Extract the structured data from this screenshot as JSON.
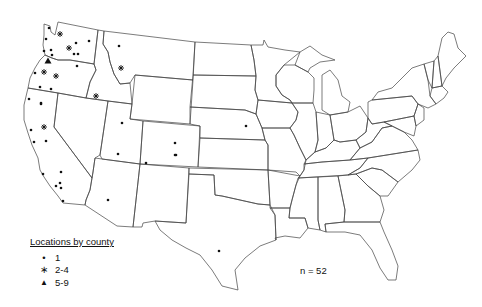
{
  "legend": {
    "title": "Locations by county",
    "items": [
      {
        "symbol": "dot",
        "glyph": "•",
        "label": "1"
      },
      {
        "symbol": "asterisk",
        "glyph": "∗",
        "label": "2-4"
      },
      {
        "symbol": "triangle",
        "glyph": "▲",
        "label": "5-9"
      }
    ]
  },
  "annotation": {
    "n_label": "n = 52"
  },
  "colors": {
    "boundary": "#444444",
    "marker": "#111111",
    "background": "#ffffff"
  },
  "markers": [
    {
      "type": "dot",
      "x": 49,
      "y": 28,
      "region": "WA"
    },
    {
      "type": "asterisk",
      "x": 60,
      "y": 34,
      "region": "WA"
    },
    {
      "type": "dot",
      "x": 46,
      "y": 39,
      "region": "WA"
    },
    {
      "type": "asterisk",
      "x": 69,
      "y": 48,
      "region": "WA"
    },
    {
      "type": "dot",
      "x": 76,
      "y": 43,
      "region": "WA"
    },
    {
      "type": "dot",
      "x": 89,
      "y": 41,
      "region": "WA"
    },
    {
      "type": "dot",
      "x": 44,
      "y": 51,
      "region": "WA"
    },
    {
      "type": "dot",
      "x": 51,
      "y": 50,
      "region": "WA"
    },
    {
      "type": "dot",
      "x": 52,
      "y": 55,
      "region": "WA"
    },
    {
      "type": "dot",
      "x": 74,
      "y": 54,
      "region": "WA"
    },
    {
      "type": "dot",
      "x": 78,
      "y": 54,
      "region": "WA"
    },
    {
      "type": "triangle",
      "x": 48,
      "y": 61,
      "region": "OR"
    },
    {
      "type": "dot",
      "x": 77,
      "y": 66,
      "region": "OR"
    },
    {
      "type": "dot",
      "x": 35,
      "y": 73,
      "region": "OR"
    },
    {
      "type": "asterisk",
      "x": 44,
      "y": 72,
      "region": "OR"
    },
    {
      "type": "asterisk",
      "x": 56,
      "y": 76,
      "region": "OR"
    },
    {
      "type": "dot",
      "x": 40,
      "y": 87,
      "region": "OR"
    },
    {
      "type": "dot",
      "x": 51,
      "y": 89,
      "region": "OR"
    },
    {
      "type": "dot",
      "x": 29,
      "y": 99,
      "region": "CA"
    },
    {
      "type": "dot",
      "x": 41,
      "y": 103,
      "region": "CA"
    },
    {
      "type": "dot",
      "x": 119,
      "y": 46,
      "region": "MT"
    },
    {
      "type": "asterisk",
      "x": 121,
      "y": 68,
      "region": "MT"
    },
    {
      "type": "asterisk",
      "x": 96,
      "y": 96,
      "region": "ID"
    },
    {
      "type": "dot",
      "x": 41,
      "y": 104,
      "region": "CA"
    },
    {
      "type": "asterisk",
      "x": 44,
      "y": 127,
      "region": "CA"
    },
    {
      "type": "dot",
      "x": 31,
      "y": 130,
      "region": "CA"
    },
    {
      "type": "dot",
      "x": 34,
      "y": 142,
      "region": "CA"
    },
    {
      "type": "dot",
      "x": 46,
      "y": 141,
      "region": "CA"
    },
    {
      "type": "dot",
      "x": 43,
      "y": 174,
      "region": "CA"
    },
    {
      "type": "dot",
      "x": 61,
      "y": 172,
      "region": "CA"
    },
    {
      "type": "dot",
      "x": 60,
      "y": 183,
      "region": "CA"
    },
    {
      "type": "dot",
      "x": 56,
      "y": 186,
      "region": "CA"
    },
    {
      "type": "dot",
      "x": 61,
      "y": 188,
      "region": "CA"
    },
    {
      "type": "dot",
      "x": 63,
      "y": 201,
      "region": "CA"
    },
    {
      "type": "dot",
      "x": 122,
      "y": 123,
      "region": "UT"
    },
    {
      "type": "dot",
      "x": 175,
      "y": 143,
      "region": "CO"
    },
    {
      "type": "dot",
      "x": 176,
      "y": 155,
      "region": "CO"
    },
    {
      "type": "dot",
      "x": 146,
      "y": 163,
      "region": "CO"
    },
    {
      "type": "dot",
      "x": 175,
      "y": 155,
      "region": "CO"
    },
    {
      "type": "dot",
      "x": 118,
      "y": 154,
      "region": "NM"
    },
    {
      "type": "dot",
      "x": 108,
      "y": 200,
      "region": "AZ"
    },
    {
      "type": "dot",
      "x": 219,
      "y": 251,
      "region": "TX"
    },
    {
      "type": "dot",
      "x": 246,
      "y": 126,
      "region": "NE"
    }
  ]
}
